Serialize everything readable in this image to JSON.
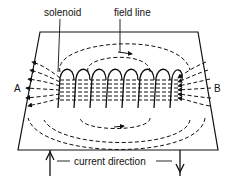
{
  "diagram": {
    "labels": {
      "solenoid": "solenoid",
      "field_line": "field line",
      "end_a": "A",
      "end_b": "B",
      "current_direction": "current direction"
    },
    "coil_turns": 8,
    "colors": {
      "ink": "#111111",
      "background": "#ffffff"
    }
  }
}
